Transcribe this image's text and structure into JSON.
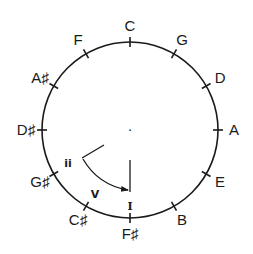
{
  "diagram": {
    "notes_clockwise_from_top": [
      "C",
      "G",
      "D",
      "A",
      "E",
      "B",
      "F♯",
      "C♯",
      "G♯",
      "D♯",
      "A♯",
      "F"
    ],
    "center_mark": "·",
    "annotations": {
      "ii": "ii",
      "V": "V",
      "I": "I"
    },
    "arrow": {
      "from": "ii",
      "to": "I",
      "description": "ii → V → I progression arrow"
    },
    "colors": {
      "stroke": "#1a1a1a",
      "background": "#ffffff"
    }
  }
}
